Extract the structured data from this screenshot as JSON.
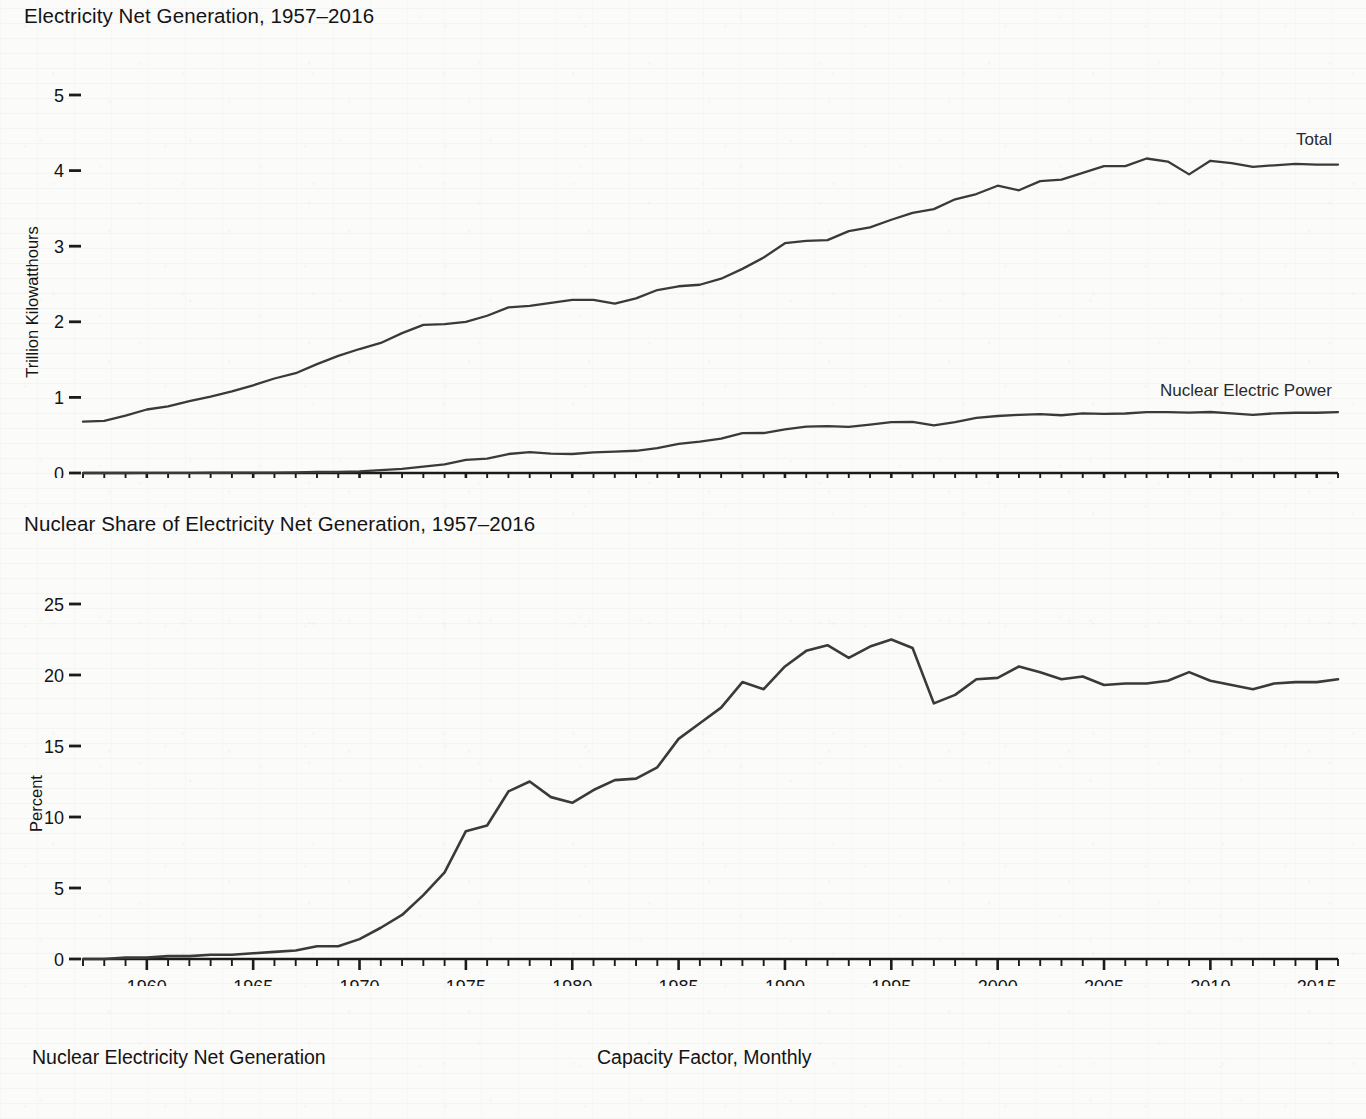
{
  "page": {
    "background_color": "#fbfbfa",
    "ink_color": "#3a3a3a"
  },
  "charts": [
    {
      "id": "electricity-net-generation",
      "title": "Electricity Net Generation, 1957–2016",
      "ylabel": "Trillion Kilowatthours",
      "xlabel": "",
      "y_ticks": [
        "0",
        "1",
        "2",
        "3",
        "4",
        "5"
      ],
      "x_ticks": [
        "1960",
        "1965",
        "1970",
        "1975",
        "1980",
        "1985",
        "1990",
        "1995",
        "2000",
        "2005",
        "2010",
        "2015"
      ],
      "series_labels": [
        "Total",
        "Nuclear Electric Power"
      ]
    },
    {
      "id": "nuclear-share",
      "title": "Nuclear Share of Electricity Net Generation, 1957–2016",
      "ylabel": "Percent",
      "xlabel": "",
      "y_ticks": [
        "0",
        "5",
        "10",
        "15",
        "20",
        "25"
      ],
      "x_ticks": [
        "1960",
        "1965",
        "1970",
        "1975",
        "1980",
        "1985",
        "1990",
        "1995",
        "2000",
        "2005",
        "2010",
        "2015"
      ],
      "series_labels": []
    }
  ],
  "captions": {
    "left": "Nuclear Electricity Net Generation",
    "right": "Capacity Factor, Monthly"
  },
  "chart_data": [
    {
      "type": "line",
      "id": "electricity-net-generation",
      "title": "Electricity Net Generation, 1957–2016",
      "xlabel": "",
      "ylabel": "Trillion Kilowatthours",
      "xlim": [
        1957,
        2016
      ],
      "ylim": [
        0,
        5
      ],
      "y_ticks": [
        0,
        1,
        2,
        3,
        4,
        5
      ],
      "x_ticks": [
        1960,
        1965,
        1970,
        1975,
        1980,
        1985,
        1990,
        1995,
        2000,
        2005,
        2010,
        2015
      ],
      "x_minor_tick_interval": 1,
      "grid": false,
      "legend": "inline-right",
      "x": [
        1957,
        1958,
        1959,
        1960,
        1961,
        1962,
        1963,
        1964,
        1965,
        1966,
        1967,
        1968,
        1969,
        1970,
        1971,
        1972,
        1973,
        1974,
        1975,
        1976,
        1977,
        1978,
        1979,
        1980,
        1981,
        1982,
        1983,
        1984,
        1985,
        1986,
        1987,
        1988,
        1989,
        1990,
        1991,
        1992,
        1993,
        1994,
        1995,
        1996,
        1997,
        1998,
        1999,
        2000,
        2001,
        2002,
        2003,
        2004,
        2005,
        2006,
        2007,
        2008,
        2009,
        2010,
        2011,
        2012,
        2013,
        2014,
        2015,
        2016
      ],
      "series": [
        {
          "name": "Total",
          "label_position": "upper-right",
          "values": [
            0.68,
            0.69,
            0.76,
            0.84,
            0.88,
            0.95,
            1.01,
            1.08,
            1.16,
            1.25,
            1.32,
            1.44,
            1.55,
            1.64,
            1.72,
            1.85,
            1.96,
            1.97,
            2.0,
            2.08,
            2.19,
            2.21,
            2.25,
            2.29,
            2.29,
            2.24,
            2.31,
            2.42,
            2.47,
            2.49,
            2.57,
            2.7,
            2.85,
            3.04,
            3.07,
            3.08,
            3.2,
            3.25,
            3.35,
            3.44,
            3.49,
            3.62,
            3.69,
            3.8,
            3.74,
            3.86,
            3.88,
            3.97,
            4.06,
            4.06,
            4.16,
            4.12,
            3.95,
            4.13,
            4.1,
            4.05,
            4.07,
            4.09,
            4.08,
            4.08
          ]
        },
        {
          "name": "Nuclear Electric Power",
          "label_position": "right",
          "values": [
            0.0,
            0.0,
            0.0,
            0.001,
            0.002,
            0.002,
            0.003,
            0.003,
            0.004,
            0.006,
            0.008,
            0.013,
            0.014,
            0.022,
            0.038,
            0.054,
            0.083,
            0.114,
            0.173,
            0.191,
            0.251,
            0.276,
            0.255,
            0.251,
            0.273,
            0.283,
            0.294,
            0.328,
            0.384,
            0.414,
            0.455,
            0.527,
            0.529,
            0.577,
            0.613,
            0.619,
            0.61,
            0.64,
            0.673,
            0.675,
            0.629,
            0.674,
            0.728,
            0.754,
            0.769,
            0.78,
            0.764,
            0.789,
            0.782,
            0.787,
            0.806,
            0.806,
            0.799,
            0.807,
            0.79,
            0.769,
            0.789,
            0.797,
            0.797,
            0.806
          ]
        }
      ]
    },
    {
      "type": "line",
      "id": "nuclear-share",
      "title": "Nuclear Share of Electricity Net Generation, 1957–2016",
      "xlabel": "",
      "ylabel": "Percent",
      "xlim": [
        1957,
        2016
      ],
      "ylim": [
        0,
        25
      ],
      "y_ticks": [
        0,
        5,
        10,
        15,
        20,
        25
      ],
      "x_ticks": [
        1960,
        1965,
        1970,
        1975,
        1980,
        1985,
        1990,
        1995,
        2000,
        2005,
        2010,
        2015
      ],
      "x_minor_tick_interval": 1,
      "grid": false,
      "legend": "none",
      "x": [
        1957,
        1958,
        1959,
        1960,
        1961,
        1962,
        1963,
        1964,
        1965,
        1966,
        1967,
        1968,
        1969,
        1970,
        1971,
        1972,
        1973,
        1974,
        1975,
        1976,
        1977,
        1978,
        1979,
        1980,
        1981,
        1982,
        1983,
        1984,
        1985,
        1986,
        1987,
        1988,
        1989,
        1990,
        1991,
        1992,
        1993,
        1994,
        1995,
        1996,
        1997,
        1998,
        1999,
        2000,
        2001,
        2002,
        2003,
        2004,
        2005,
        2006,
        2007,
        2008,
        2009,
        2010,
        2011,
        2012,
        2013,
        2014,
        2015,
        2016
      ],
      "series": [
        {
          "name": "Nuclear Share",
          "values": [
            0.0,
            0.0,
            0.1,
            0.1,
            0.2,
            0.2,
            0.3,
            0.3,
            0.4,
            0.5,
            0.6,
            0.9,
            0.9,
            1.4,
            2.2,
            3.1,
            4.5,
            6.1,
            9.0,
            9.4,
            11.8,
            12.5,
            11.4,
            11.0,
            11.9,
            12.6,
            12.7,
            13.5,
            15.5,
            16.6,
            17.7,
            19.5,
            19.0,
            20.6,
            21.7,
            22.1,
            21.2,
            22.0,
            22.5,
            21.9,
            18.0,
            18.6,
            19.7,
            19.8,
            20.6,
            20.2,
            19.7,
            19.9,
            19.3,
            19.4,
            19.4,
            19.6,
            20.2,
            19.6,
            19.3,
            19.0,
            19.4,
            19.5,
            19.5,
            19.7
          ]
        }
      ]
    }
  ]
}
